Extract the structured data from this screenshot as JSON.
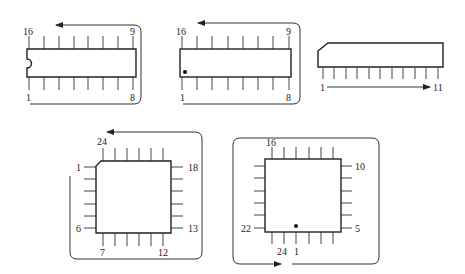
{
  "diagram": {
    "packages": [
      {
        "id": "dip16-notch",
        "type": "DIP-16",
        "orientation_mark": "notch",
        "labels": {
          "top_left": "16",
          "top_right": "9",
          "bottom_left": "1",
          "bottom_right": "8"
        }
      },
      {
        "id": "dip16-dot",
        "type": "DIP-16",
        "orientation_mark": "dot",
        "labels": {
          "top_left": "16",
          "top_right": "9",
          "bottom_left": "1",
          "bottom_right": "8"
        }
      },
      {
        "id": "sip11",
        "type": "SIP-11",
        "orientation_mark": "chamfered corner",
        "labels": {
          "start": "1",
          "end": "11"
        }
      },
      {
        "id": "plcc24-chamfer",
        "type": "Quad-24",
        "orientation_mark": "chamfered corner",
        "labels": {
          "top_left": "24",
          "left_top": "1",
          "right_top": "18",
          "left_bottom": "6",
          "right_bottom": "13",
          "bottom_left": "7",
          "bottom_right": "12"
        }
      },
      {
        "id": "plcc24-dot",
        "type": "Quad-24",
        "orientation_mark": "dot",
        "labels": {
          "top_left": "16",
          "right_top": "10",
          "left_bottom": "22",
          "right_bottom": "5",
          "bottom_a": "24",
          "bottom_b": "1"
        }
      }
    ],
    "colors": {
      "line": "#333333",
      "body": "#222222",
      "background": "#ffffff"
    }
  }
}
